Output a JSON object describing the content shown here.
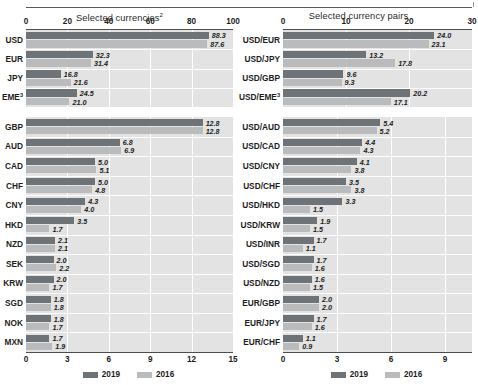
{
  "header": {
    "rule": true
  },
  "legend": {
    "items": [
      {
        "label": "2019",
        "color": "#6e7378"
      },
      {
        "label": "2016",
        "color": "#b9bbbd"
      }
    ]
  },
  "panels": {
    "left_title": "Selected currencies",
    "left_title_sup": "2",
    "right_title": "Selected currency pairs"
  },
  "chart_data": [
    {
      "id": "left-top",
      "type": "bar",
      "orientation": "horizontal",
      "title": "Selected currencies",
      "title_footnote": "2",
      "xlabel": "",
      "ylabel": "",
      "xlim": [
        0,
        100
      ],
      "ticks": [
        0,
        20,
        40,
        60,
        80,
        100
      ],
      "grid": true,
      "legend_position": "bottom-center",
      "categories": [
        "USD",
        "EUR",
        "JPY",
        "EME"
      ],
      "category_footnotes": {
        "EME": "3"
      },
      "series": [
        {
          "name": "2019",
          "color": "#6e7378",
          "values": [
            88.3,
            32.3,
            16.8,
            24.5
          ]
        },
        {
          "name": "2016",
          "color": "#b9bbbd",
          "values": [
            87.6,
            31.4,
            21.6,
            21.0
          ]
        }
      ]
    },
    {
      "id": "left-bottom",
      "type": "bar",
      "orientation": "horizontal",
      "title": "",
      "xlabel": "",
      "ylabel": "",
      "xlim": [
        0,
        15
      ],
      "ticks": [
        0,
        3,
        6,
        9,
        12,
        15
      ],
      "grid": true,
      "legend_position": "bottom-center",
      "categories": [
        "GBP",
        "AUD",
        "CAD",
        "CHF",
        "CNY",
        "HKD",
        "NZD",
        "SEK",
        "KRW",
        "SGD",
        "NOK",
        "MXN"
      ],
      "series": [
        {
          "name": "2019",
          "color": "#6e7378",
          "values": [
            12.8,
            6.8,
            5.0,
            5.0,
            4.3,
            3.5,
            2.1,
            2.0,
            2.0,
            1.8,
            1.8,
            1.7
          ]
        },
        {
          "name": "2016",
          "color": "#b9bbbd",
          "values": [
            12.8,
            6.9,
            5.1,
            4.8,
            4.0,
            1.7,
            2.1,
            2.2,
            1.7,
            1.8,
            1.7,
            1.9
          ]
        }
      ]
    },
    {
      "id": "right-top",
      "type": "bar",
      "orientation": "horizontal",
      "title": "Selected currency pairs",
      "xlabel": "",
      "ylabel": "",
      "xlim": [
        0,
        30
      ],
      "ticks": [
        0,
        10,
        20,
        30
      ],
      "grid": true,
      "legend_position": "bottom-center",
      "categories": [
        "USD/EUR",
        "USD/JPY",
        "USD/GBP",
        "USD/EME"
      ],
      "category_footnotes": {
        "USD/EME": "3"
      },
      "series": [
        {
          "name": "2019",
          "color": "#6e7378",
          "values": [
            24.0,
            13.2,
            9.6,
            20.2
          ]
        },
        {
          "name": "2016",
          "color": "#b9bbbd",
          "values": [
            23.1,
            17.8,
            9.3,
            17.1
          ]
        }
      ]
    },
    {
      "id": "right-bottom",
      "type": "bar",
      "orientation": "horizontal",
      "title": "",
      "xlabel": "",
      "ylabel": "",
      "xlim": [
        0,
        10.5
      ],
      "ticks": [
        0,
        3,
        6,
        9
      ],
      "grid": true,
      "legend_position": "bottom-center",
      "categories": [
        "USD/AUD",
        "USD/CAD",
        "USD/CNY",
        "USD/CHF",
        "USD/HKD",
        "USD/KRW",
        "USD/INR",
        "USD/SGD",
        "USD/NZD",
        "EUR/GBP",
        "EUR/JPY",
        "EUR/CHF"
      ],
      "series": [
        {
          "name": "2019",
          "color": "#6e7378",
          "values": [
            5.4,
            4.4,
            4.1,
            3.5,
            3.3,
            1.9,
            1.7,
            1.7,
            1.6,
            2.0,
            1.7,
            1.1
          ]
        },
        {
          "name": "2016",
          "color": "#b9bbbd",
          "values": [
            5.2,
            4.3,
            3.8,
            3.8,
            1.5,
            1.5,
            1.1,
            1.6,
            1.5,
            2.0,
            1.6,
            0.9
          ]
        }
      ]
    }
  ]
}
